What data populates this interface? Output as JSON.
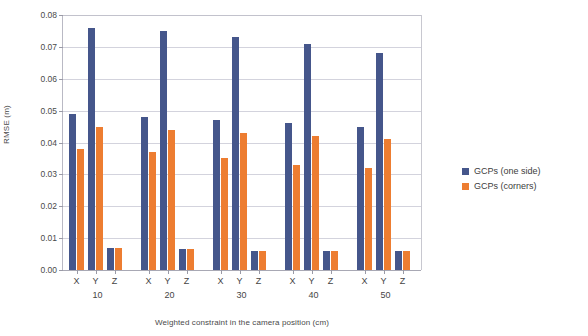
{
  "chart_data": {
    "type": "bar",
    "title": "",
    "xlabel": "Weighted constraint in the camera position (cm)",
    "ylabel": "RMSE (m)",
    "ylim": [
      0.0,
      0.08
    ],
    "ytick_labels": [
      "0.00",
      "0.01",
      "0.02",
      "0.03",
      "0.04",
      "0.05",
      "0.06",
      "0.07",
      "0.08"
    ],
    "ytick_values": [
      0.0,
      0.01,
      0.02,
      0.03,
      0.04,
      0.05,
      0.06,
      0.07,
      0.08
    ],
    "grid": true,
    "legend_position": "right",
    "groups": [
      "10",
      "20",
      "30",
      "40",
      "50"
    ],
    "subcategories": [
      "X",
      "Y",
      "Z"
    ],
    "categories": [
      "10-X",
      "10-Y",
      "10-Z",
      "20-X",
      "20-Y",
      "20-Z",
      "30-X",
      "30-Y",
      "30-Z",
      "40-X",
      "40-Y",
      "40-Z",
      "50-X",
      "50-Y",
      "50-Z"
    ],
    "series": [
      {
        "name": "GCPs (one side)",
        "color": "#45568b",
        "values": [
          0.049,
          0.076,
          0.007,
          0.048,
          0.075,
          0.0065,
          0.047,
          0.073,
          0.006,
          0.046,
          0.071,
          0.006,
          0.045,
          0.068,
          0.006
        ]
      },
      {
        "name": "GCPs (corners)",
        "color": "#ed7d31",
        "values": [
          0.038,
          0.045,
          0.007,
          0.037,
          0.044,
          0.0065,
          0.035,
          0.043,
          0.006,
          0.033,
          0.042,
          0.006,
          0.032,
          0.041,
          0.006
        ]
      }
    ]
  },
  "legend": {
    "entries": [
      {
        "label": "GCPs (one side)"
      },
      {
        "label": "GCPs (corners)"
      }
    ]
  }
}
